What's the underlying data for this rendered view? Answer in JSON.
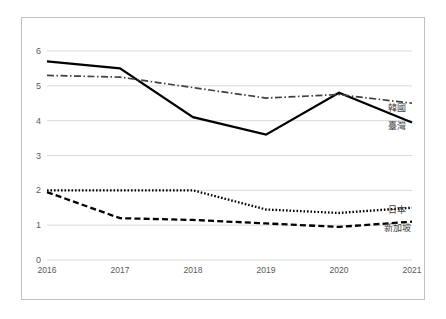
{
  "chart_data": {
    "type": "line",
    "title": "",
    "subtitle": "",
    "xlabel": "",
    "ylabel": "",
    "categories": [
      "2016",
      "2017",
      "2018",
      "2019",
      "2020",
      "2021"
    ],
    "x": [
      2016,
      2017,
      2018,
      2019,
      2020,
      2021
    ],
    "ylim": [
      0,
      6
    ],
    "yticks": [
      "0",
      "1",
      "2",
      "3",
      "4",
      "5",
      "6"
    ],
    "ytick_values": [
      0,
      1,
      2,
      3,
      4,
      5,
      6
    ],
    "grid": "horizontal",
    "legend_position": "right-of-plot-inline",
    "series": [
      {
        "name": "臺灣",
        "style": "solid",
        "color": "#000000",
        "values": [
          5.7,
          5.5,
          4.1,
          3.6,
          4.8,
          3.95
        ]
      },
      {
        "name": "韓國",
        "style": "dash-dot",
        "color": "#404040",
        "values": [
          5.3,
          5.25,
          4.95,
          4.65,
          4.75,
          4.5
        ]
      },
      {
        "name": "日本",
        "style": "dotted",
        "color": "#000000",
        "values": [
          2.0,
          2.0,
          2.0,
          1.45,
          1.35,
          1.5
        ]
      },
      {
        "name": "新加坡",
        "style": "dashed",
        "color": "#000000",
        "values": [
          1.95,
          1.2,
          1.15,
          1.05,
          0.95,
          1.1
        ]
      }
    ],
    "annotations": []
  },
  "axis": {
    "y_labels": [
      "6",
      "5",
      "4",
      "3",
      "2",
      "1",
      "0"
    ],
    "x_labels": [
      "2016",
      "2017",
      "2018",
      "2019",
      "2020",
      "2021"
    ]
  },
  "legend": {
    "items": [
      {
        "label": "韓國"
      },
      {
        "label": "臺灣"
      },
      {
        "label": "日本"
      },
      {
        "label": "新加坡"
      }
    ]
  },
  "colors": {
    "frame": "#bfbfbf",
    "gridline": "#d9d9d9",
    "tick_text": "#595959",
    "series_line": "#000000",
    "background": "#ffffff"
  }
}
